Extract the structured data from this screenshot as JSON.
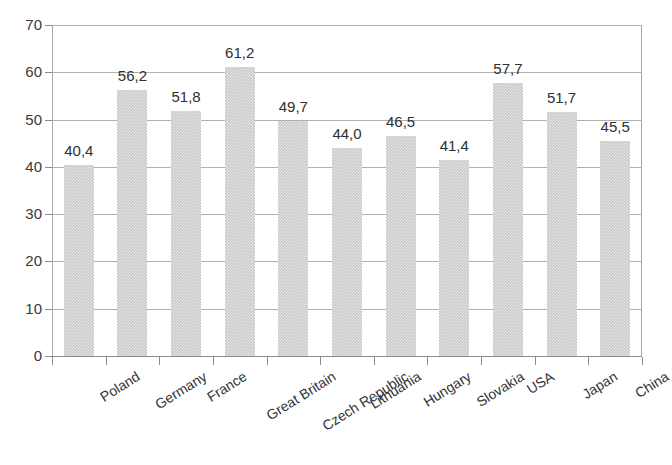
{
  "chart_data": {
    "type": "bar",
    "title": "",
    "subtitle": "",
    "xlabel": "",
    "ylabel": "",
    "ylim": [
      0,
      70
    ],
    "ytick_step": 10,
    "ytick_labels": [
      "70",
      "60",
      "50",
      "40",
      "30",
      "20",
      "10",
      "0"
    ],
    "ytick_values": [
      70,
      60,
      50,
      40,
      30,
      20,
      10,
      0
    ],
    "grid": true,
    "legend": null,
    "decimal_separator": ",",
    "bar_color": "#c9c9c9",
    "bar_pattern": "checkered-dither",
    "gridline_color": "#b0b0b0",
    "axis_color": "#8c8c8c",
    "label_color": "#2f2f2f",
    "categories": [
      "Poland",
      "Germany",
      "France",
      "Great Britain",
      "Czech Republic",
      "Lithuania",
      "Hungary",
      "Slovakia",
      "USA",
      "Japan",
      "China"
    ],
    "values": [
      40.4,
      56.2,
      51.8,
      61.2,
      49.7,
      44.0,
      46.5,
      41.4,
      57.7,
      51.7,
      45.5
    ],
    "value_labels": [
      "40,4",
      "56,2",
      "51,8",
      "61,2",
      "49,7",
      "44,0",
      "46,5",
      "41,4",
      "57,7",
      "51,7",
      "45,5"
    ],
    "points": [
      {
        "category": "Poland",
        "value": 40.4,
        "label": "40,4"
      },
      {
        "category": "Germany",
        "value": 56.2,
        "label": "56,2"
      },
      {
        "category": "France",
        "value": 51.8,
        "label": "51,8"
      },
      {
        "category": "Great Britain",
        "value": 61.2,
        "label": "61,2"
      },
      {
        "category": "Czech Republic",
        "value": 49.7,
        "label": "49,7"
      },
      {
        "category": "Lithuania",
        "value": 44.0,
        "label": "44,0"
      },
      {
        "category": "Hungary",
        "value": 46.5,
        "label": "46,5"
      },
      {
        "category": "Slovakia",
        "value": 41.4,
        "label": "41,4"
      },
      {
        "category": "USA",
        "value": 57.7,
        "label": "57,7"
      },
      {
        "category": "Japan",
        "value": 51.7,
        "label": "51,7"
      },
      {
        "category": "China",
        "value": 45.5,
        "label": "45,5"
      }
    ]
  }
}
